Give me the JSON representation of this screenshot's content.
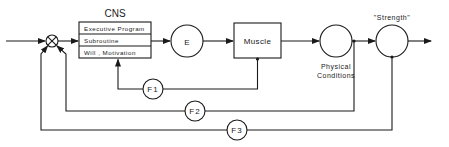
{
  "diagram": {
    "cns": {
      "title": "CNS",
      "rows": [
        "Executive Program",
        "Subroutine",
        "Will , Motivation"
      ]
    },
    "e_block": "E",
    "muscle_block": "Muscle",
    "physical_conditions": {
      "line1": "Physical",
      "line2": "Conditions"
    },
    "strength_label": "\"Strength\"",
    "feedback": [
      "F1",
      "F2",
      "F3"
    ],
    "colors": {
      "line": "#1a1a1a",
      "background": "#ffffff"
    }
  }
}
